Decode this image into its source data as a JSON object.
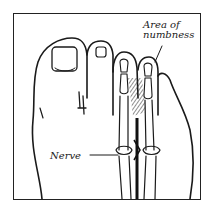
{
  "figure": {
    "labels": {
      "area_line1": "Area of",
      "area_line2": "numbness",
      "nerve": "Nerve"
    },
    "colors": {
      "ink": "#1a1a1a",
      "background": "#ffffff",
      "hatch": "#333333"
    }
  }
}
